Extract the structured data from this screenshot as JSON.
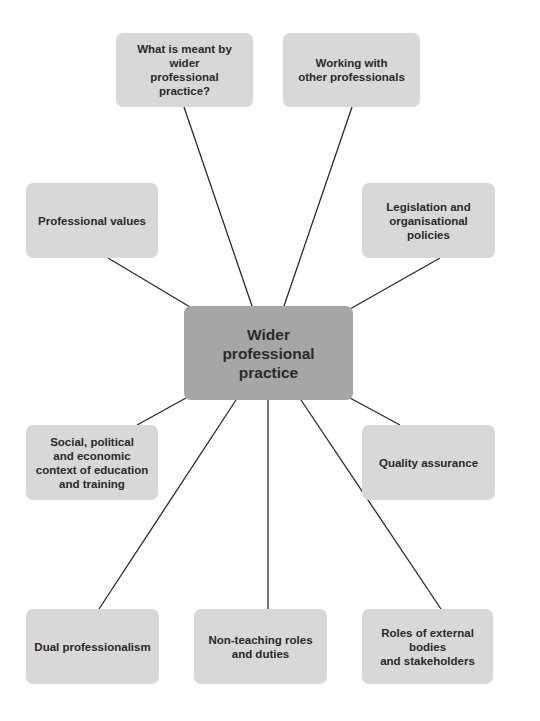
{
  "diagram": {
    "type": "mind-map",
    "center": {
      "label": "Wider\nprofessional\npractice",
      "color": "#a6a6a6"
    },
    "node_color": "#d8d8d8",
    "line_color": "#2a2a2a",
    "nodes": [
      {
        "id": "meaning",
        "label": "What is meant by wider\nprofessional practice?"
      },
      {
        "id": "working",
        "label": "Working with\nother professionals"
      },
      {
        "id": "values",
        "label": "Professional values"
      },
      {
        "id": "legislation",
        "label": "Legislation and\norganisational policies"
      },
      {
        "id": "social",
        "label": "Social, political\nand economic\ncontext of education\nand training"
      },
      {
        "id": "quality",
        "label": "Quality assurance"
      },
      {
        "id": "dual",
        "label": "Dual professionalism"
      },
      {
        "id": "nonteaching",
        "label": "Non-teaching roles\nand duties"
      },
      {
        "id": "external",
        "label": "Roles of external bodies\nand stakeholders"
      }
    ]
  }
}
